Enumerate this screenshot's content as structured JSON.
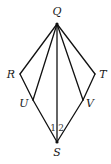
{
  "diagram": {
    "points": {
      "Q": {
        "label": "Q",
        "x": 57,
        "y": 24,
        "lx": 57,
        "ly": 15
      },
      "R": {
        "label": "R",
        "x": 20,
        "y": 74,
        "lx": 11,
        "ly": 78
      },
      "T": {
        "label": "T",
        "x": 95,
        "y": 74,
        "lx": 103,
        "ly": 78
      },
      "U": {
        "label": "U",
        "x": 33,
        "y": 100,
        "lx": 24,
        "ly": 107
      },
      "V": {
        "label": "V",
        "x": 83,
        "y": 100,
        "lx": 90,
        "ly": 107
      },
      "S": {
        "label": "S",
        "x": 57,
        "y": 142,
        "lx": 57,
        "ly": 156
      }
    },
    "segments": [
      [
        "Q",
        "R"
      ],
      [
        "R",
        "U"
      ],
      [
        "Q",
        "T"
      ],
      [
        "T",
        "V"
      ],
      [
        "Q",
        "U"
      ],
      [
        "Q",
        "V"
      ],
      [
        "Q",
        "S"
      ],
      [
        "U",
        "S"
      ],
      [
        "V",
        "S"
      ]
    ],
    "angle_labels": [
      {
        "text": "1",
        "x": 53,
        "y": 131
      },
      {
        "text": "2",
        "x": 61,
        "y": 131
      }
    ]
  }
}
